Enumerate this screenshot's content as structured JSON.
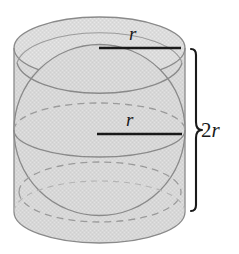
{
  "figure": {
    "background_color": "#ffffff",
    "labels": {
      "radius_top": "r",
      "radius_middle": "r",
      "height_prefix": "2",
      "height_var": "r",
      "height_full": "2r"
    },
    "colors": {
      "solid_fill": "#d7d7d7",
      "cap_fill": "#dcdcdc",
      "outline": "#8a8a8a",
      "hidden_line": "#9b9b9b",
      "measure_line": "#1a1a1a",
      "brace": "#1a1a1a",
      "label_text": "#1a1a1a"
    },
    "geometry": {
      "cylinder": {
        "left_x": 14,
        "right_x": 185,
        "top_center_y": 48,
        "bottom_center_y": 212,
        "ellipse_rx": 85.5,
        "ellipse_ry": 31,
        "height_px": 164
      },
      "sphere": {
        "center_x": 99.5,
        "center_y": 130,
        "radius_px": 85.5,
        "equator_ry": 27
      },
      "radius_line_top": {
        "x1": 99,
        "y1": 48,
        "x2": 181,
        "y2": 48
      },
      "radius_line_middle": {
        "x1": 97,
        "y1": 134,
        "x2": 182,
        "y2": 134
      },
      "brace": {
        "x": 196,
        "top_y": 48,
        "bottom_y": 212,
        "tip_x": 207,
        "mid_y": 130
      }
    }
  }
}
